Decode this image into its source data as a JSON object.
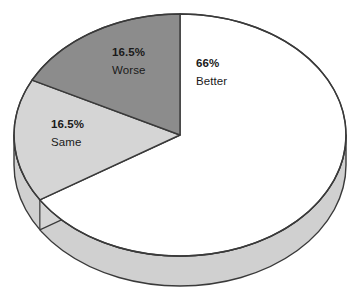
{
  "chart_data": {
    "type": "pie",
    "title": "",
    "subtitle": "",
    "xlabel": "",
    "ylabel": "",
    "grid": false,
    "legend_position": "none",
    "label_style": "inside-slice",
    "start_angle_deg": 0,
    "direction": "clockwise",
    "style": "3d-pie",
    "categories": [
      "Better",
      "Same",
      "Worse"
    ],
    "values": [
      66,
      16.5,
      16.5
    ],
    "value_unit": "percent",
    "slices": [
      {
        "name": "Better",
        "value": 66,
        "value_label": "66%",
        "color": "#ffffff",
        "start_deg": 0,
        "end_deg": 237.6
      },
      {
        "name": "Same",
        "value": 16.5,
        "value_label": "16.5%",
        "color": "#d5d5d5",
        "start_deg": 237.6,
        "end_deg": 297.0
      },
      {
        "name": "Worse",
        "value": 16.5,
        "value_label": "16.5%",
        "color": "#8c8c8c",
        "start_deg": 297.0,
        "end_deg": 360.0
      }
    ],
    "colors": {
      "better": "#ffffff",
      "same": "#d5d5d5",
      "worse": "#8c8c8c",
      "side_wall": "#d0d0d0",
      "outline": "#3a3a3a",
      "background": "#ffffff",
      "text": "#1a1a1a"
    }
  },
  "labels": {
    "better": {
      "pct": "66%",
      "name": "Better"
    },
    "worse": {
      "pct": "16.5%",
      "name": "Worse"
    },
    "same": {
      "pct": "16.5%",
      "name": "Same"
    }
  }
}
